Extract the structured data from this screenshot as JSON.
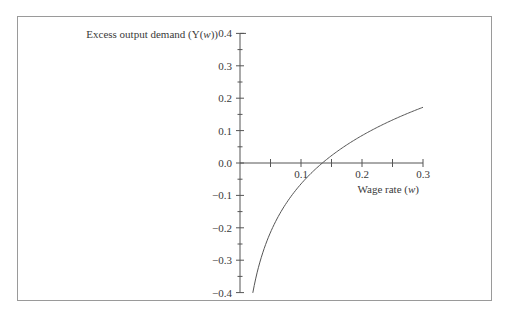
{
  "chart_data": {
    "type": "line",
    "title": "",
    "xlabel": "Wage rate (w)",
    "ylabel": "Excess output demand (Y(w))",
    "xlim": [
      0,
      0.3
    ],
    "ylim": [
      -0.4,
      0.4
    ],
    "grid": false,
    "legend": null,
    "x_ticks": [
      0.05,
      0.1,
      0.15,
      0.2,
      0.25,
      0.3
    ],
    "x_tick_labels": [
      "0.1",
      "0.2",
      "0.3"
    ],
    "x_tick_label_values": [
      0.1,
      0.2,
      0.3
    ],
    "y_ticks": [
      -0.4,
      -0.35,
      -0.3,
      -0.25,
      -0.2,
      -0.15,
      -0.1,
      -0.05,
      0.0,
      0.05,
      0.1,
      0.15,
      0.2,
      0.25,
      0.3,
      0.35,
      0.4
    ],
    "y_tick_labels": [
      "0.4",
      "0.3",
      "0.2",
      "0.1",
      "0.0",
      "−0.1",
      "−0.2",
      "−0.3",
      "−0.4"
    ],
    "y_tick_label_values": [
      0.4,
      0.3,
      0.2,
      0.1,
      0.0,
      -0.1,
      -0.2,
      -0.3,
      -0.4
    ],
    "series": [
      {
        "name": "Y(w)",
        "x": [
          0.021,
          0.025,
          0.03,
          0.035,
          0.04,
          0.05,
          0.06,
          0.07,
          0.08,
          0.09,
          0.1,
          0.11,
          0.12,
          0.135,
          0.15,
          0.16,
          0.18,
          0.2,
          0.22,
          0.24,
          0.26,
          0.28,
          0.3
        ],
        "values": [
          -0.4,
          -0.363,
          -0.324,
          -0.291,
          -0.262,
          -0.214,
          -0.175,
          -0.141,
          -0.113,
          -0.087,
          -0.065,
          -0.044,
          -0.025,
          0.0,
          0.023,
          0.037,
          0.062,
          0.085,
          0.105,
          0.124,
          0.141,
          0.157,
          0.172
        ]
      }
    ],
    "annotations": []
  },
  "labels": {
    "y_axis_title": "Excess output demand (Y(w))",
    "x_axis_title": "Wage rate (w)"
  },
  "colors": {
    "axis": "#555555",
    "curve": "#555555",
    "frame": "#9a9a9a",
    "text": "#3a3a3a"
  }
}
